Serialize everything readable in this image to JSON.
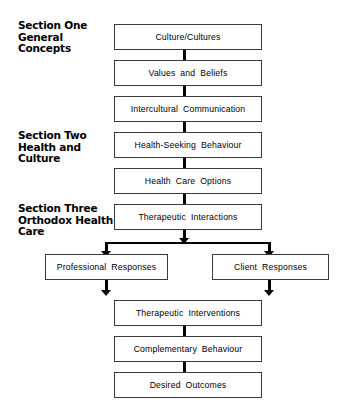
{
  "figure": {
    "type": "flowchart",
    "orientation": "top-to-bottom",
    "sections": [
      {
        "id": "section-one",
        "label": "Section One\nGeneral\nConcepts"
      },
      {
        "id": "section-two",
        "label": "Section Two\nHealth and\nCulture"
      },
      {
        "id": "section-three",
        "label": "Section Three\nOrthodox Health\nCare"
      }
    ],
    "nodes": [
      {
        "id": "culture-cultures",
        "label": "Culture/Cultures"
      },
      {
        "id": "values-and-beliefs",
        "label": "Values  and  Beliefs"
      },
      {
        "id": "intercultural-communication",
        "label": "Intercultural  Communication"
      },
      {
        "id": "health-seeking-behaviour",
        "label": "Health-Seeking  Behaviour"
      },
      {
        "id": "health-care-options",
        "label": "Health  Care  Options"
      },
      {
        "id": "therapeutic-interactions",
        "label": "Therapeutic  Interactions"
      },
      {
        "id": "professional-responses",
        "label": "Professional  Responses"
      },
      {
        "id": "client-responses",
        "label": "Client  Responses"
      },
      {
        "id": "therapeutic-interventions",
        "label": "Therapeutic  Interventions"
      },
      {
        "id": "complementary-behaviour",
        "label": "Complementary  Behaviour"
      },
      {
        "id": "desired-outcomes",
        "label": "Desired  Outcomes"
      }
    ],
    "colors": {
      "box_border": "#3b3b3b",
      "arrow": "#000000",
      "background": "#ffffff",
      "text": "#000000"
    }
  }
}
